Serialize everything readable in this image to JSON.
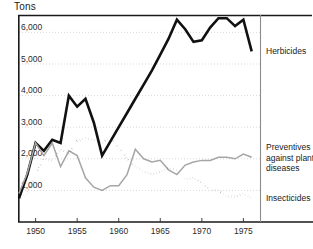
{
  "figure": {
    "unit_label": "Tons",
    "background_color": "#ffffff"
  },
  "axes": {
    "y_tick_labels": [
      "1,000",
      "2,000",
      "3,000",
      "4,000",
      "5,000",
      "6,000"
    ],
    "x_tick_labels": [
      "1950",
      "1955",
      "1960",
      "1965",
      "1970",
      "1975"
    ]
  },
  "legend": {
    "herbicides_label": "Herbicides",
    "preventives_label": "Preventives against plant diseases",
    "insecticides_label": "Insecticides"
  },
  "chart_data": {
    "type": "line",
    "title": "",
    "subtitle": "",
    "xlabel": "",
    "ylabel": "Tons",
    "xlim": [
      1948,
      1977
    ],
    "ylim": [
      0,
      6800
    ],
    "yticks": [
      1000,
      2000,
      3000,
      4000,
      5000,
      6000
    ],
    "ytick_labels": [
      "1,000",
      "2,000",
      "3,000",
      "4,000",
      "5,000",
      "6,000"
    ],
    "xticks": [
      1950,
      1955,
      1960,
      1965,
      1970,
      1975
    ],
    "xtick_labels": [
      "1950",
      "1955",
      "1960",
      "1965",
      "1970",
      "1975"
    ],
    "grid": "horizontal-dotted-gray",
    "legend_position": "right-of-plot-at-line-ends",
    "x": [
      1948,
      1949,
      1950,
      1951,
      1952,
      1953,
      1954,
      1955,
      1956,
      1957,
      1958,
      1959,
      1960,
      1961,
      1962,
      1963,
      1964,
      1965,
      1966,
      1967,
      1968,
      1969,
      1970,
      1971,
      1972,
      1973,
      1974,
      1975,
      1976
    ],
    "series": [
      {
        "name": "Herbicides",
        "style": "solid-thick-black",
        "color": "#111111",
        "values": [
          750,
          1500,
          2500,
          2250,
          2600,
          2500,
          4000,
          3650,
          3900,
          3150,
          2100,
          2550,
          3000,
          3450,
          3900,
          4350,
          4800,
          5300,
          5800,
          6400,
          6100,
          5700,
          5750,
          6150,
          6450,
          6450,
          6200,
          6400,
          5400
        ]
      },
      {
        "name": "Preventives against plant diseases",
        "style": "solid-thin-gray",
        "color": "#a6a6a6",
        "values": [
          900,
          1550,
          2500,
          2100,
          2500,
          1750,
          2250,
          2100,
          1400,
          1100,
          1000,
          1150,
          1150,
          1500,
          2300,
          2000,
          1900,
          1950,
          1650,
          1500,
          1800,
          1900,
          1950,
          1950,
          2050,
          2050,
          2000,
          2150,
          2050
        ]
      },
      {
        "name": "Insecticides",
        "style": "dotted-black",
        "color": "#111111",
        "values": [
          700,
          900,
          1550,
          2000,
          1950,
          2300,
          2150,
          2550,
          2650,
          2600,
          2500,
          2700,
          2350,
          2000,
          1750,
          1600,
          1500,
          1600,
          1700,
          1650,
          1350,
          1400,
          1250,
          1000,
          1000,
          800,
          800,
          900,
          750
        ]
      }
    ]
  }
}
